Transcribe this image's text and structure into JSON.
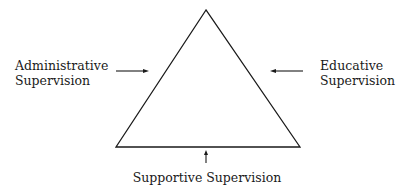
{
  "diagram": {
    "shape": "triangle",
    "labels": {
      "left": [
        "Administrative",
        "Supervision"
      ],
      "right": [
        "Educative",
        "Supervision"
      ],
      "bottom": "Supportive Supervision"
    },
    "arrows": [
      {
        "from": "left-label",
        "direction": "right",
        "target": "left side"
      },
      {
        "from": "right-label",
        "direction": "left",
        "target": "right side"
      },
      {
        "from": "bottom-label",
        "direction": "up",
        "target": "base"
      }
    ],
    "colors": {
      "stroke": "#1a1a1a",
      "background": "#ffffff"
    }
  }
}
